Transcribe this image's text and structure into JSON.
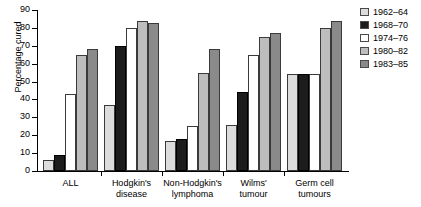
{
  "chart_data": {
    "type": "bar",
    "title": "",
    "xlabel": "",
    "ylabel": "Percentage cured",
    "ylim": [
      0,
      90
    ],
    "yticks": [
      0,
      10,
      20,
      30,
      40,
      50,
      60,
      70,
      80,
      90
    ],
    "grid": false,
    "legend_position": "right",
    "categories": [
      "ALL",
      "Hodgkin's disease",
      "Non-Hodgkin's lymphoma",
      "Wilms' tumour",
      "Germ cell tumours"
    ],
    "category_lines": [
      [
        "ALL"
      ],
      [
        "Hodgkin's",
        "disease"
      ],
      [
        "Non-Hodgkin's",
        "lymphoma"
      ],
      [
        "Wilms'",
        "tumour"
      ],
      [
        "Germ cell",
        "tumours"
      ]
    ],
    "series": [
      {
        "name": "1962–64",
        "color": "#dcdcdc",
        "values": [
          6,
          37,
          17,
          26,
          54
        ]
      },
      {
        "name": "1968–70",
        "color": "#1c1c1c",
        "values": [
          9,
          70,
          18,
          44,
          54
        ]
      },
      {
        "name": "1974–76",
        "color": "#ffffff",
        "values": [
          43,
          80,
          25,
          65,
          54
        ]
      },
      {
        "name": "1980–82",
        "color": "#bdbdbd",
        "values": [
          65,
          84,
          55,
          75,
          80
        ]
      },
      {
        "name": "1983–85",
        "color": "#8a8a8a",
        "values": [
          68,
          83,
          68,
          77,
          84
        ]
      }
    ]
  }
}
